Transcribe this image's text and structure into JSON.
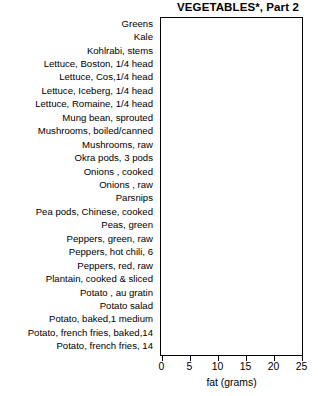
{
  "chart_data": {
    "type": "bar",
    "orientation": "horizontal",
    "title": "VEGETABLES*, Part 2",
    "xlabel": "fat (grams)",
    "ylabel": "",
    "xlim": [
      0,
      25
    ],
    "xticks": [
      0,
      5,
      10,
      15,
      20,
      25
    ],
    "grid": false,
    "legend": null,
    "categories": [
      "Greens",
      "Kale",
      "Kohlrabi, stems",
      "Lettuce, Boston, 1/4 head",
      "Lettuce, Cos,1/4 head",
      "Lettuce, Iceberg, 1/4 head",
      "Lettuce, Romaine, 1/4 head",
      "Mung bean, sprouted",
      "Mushrooms, boiled/canned",
      "Mushrooms, raw",
      "Okra pods, 3 pods",
      "Onions , cooked",
      "Onions , raw",
      "Parsnips",
      "Pea pods, Chinese, cooked",
      "Peas, green",
      "Peppers, green, raw",
      "Peppers, hot chili, 6",
      "Peppers, red, raw",
      "Plantain, cooked & sliced",
      "Potato , au gratin",
      "Potato salad",
      "Potato, baked,1 medium",
      "Potato, french fries, baked,14",
      "Potato, french fries, 14"
    ],
    "values": [
      1,
      1,
      0,
      0,
      0,
      0,
      0,
      0,
      1,
      0,
      0,
      0,
      0,
      0,
      0,
      1,
      0,
      0,
      0,
      0,
      15,
      21,
      0,
      6,
      11
    ],
    "value_labels": [
      "1",
      "1",
      "0",
      "0",
      "0",
      "0",
      "0",
      "0",
      "1",
      "0",
      "0",
      "0",
      "0",
      "0",
      "0",
      "1",
      "0",
      "0",
      "0",
      "0",
      "15",
      "21",
      "0",
      "6",
      "11"
    ],
    "xtick_labels": [
      "0",
      "5",
      "10",
      "15",
      "20",
      "25"
    ],
    "bar_color": "#ffffff",
    "bar_edge_color": "#000000",
    "bar_shadow_color": "#000000",
    "background_color": "#ffffff"
  }
}
